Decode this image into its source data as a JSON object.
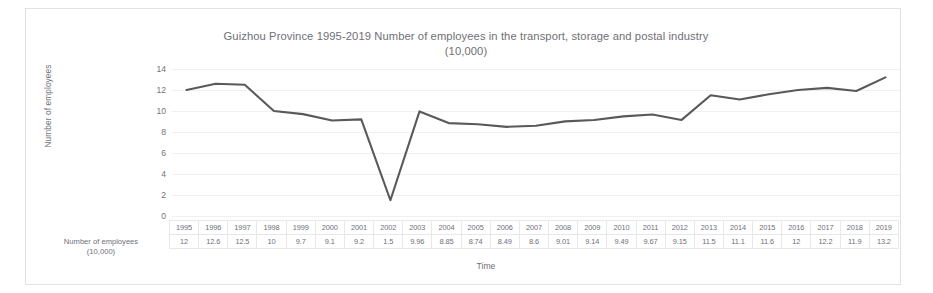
{
  "chart_data": {
    "type": "line",
    "title": "Guizhou Province 1995-2019 Number of employees in the transport, storage and postal industry (10,000)",
    "title_line1": "Guizhou Province 1995-2019 Number of employees in the transport, storage and postal industry",
    "title_line2": "(10,000)",
    "xlabel": "Time",
    "ylabel": "Number of employees",
    "ylim": [
      0,
      14
    ],
    "yticks": [
      0,
      2,
      4,
      6,
      8,
      10,
      12,
      14
    ],
    "grid": true,
    "legend": "none",
    "line_color": "#595959",
    "categories": [
      "1995",
      "1996",
      "1997",
      "1998",
      "1999",
      "2000",
      "2001",
      "2002",
      "2003",
      "2004",
      "2005",
      "2006",
      "2007",
      "2008",
      "2009",
      "2010",
      "2011",
      "2012",
      "2013",
      "2014",
      "2015",
      "2016",
      "2017",
      "2018",
      "2019"
    ],
    "values": [
      12,
      12.6,
      12.5,
      10,
      9.7,
      9.1,
      9.2,
      1.5,
      9.96,
      8.85,
      8.74,
      8.49,
      8.6,
      9.01,
      9.14,
      9.49,
      9.67,
      9.15,
      11.5,
      11.1,
      11.6,
      12,
      12.2,
      11.9,
      13.2
    ],
    "value_labels": [
      "12",
      "12.6",
      "12.5",
      "10",
      "9.7",
      "9.1",
      "9.2",
      "1.5",
      "9.96",
      "8.85",
      "8.74",
      "8.49",
      "8.6",
      "9.01",
      "9.14",
      "9.49",
      "9.67",
      "9.15",
      "11.5",
      "11.1",
      "11.6",
      "12",
      "12.2",
      "11.9",
      "13.2"
    ],
    "table_row_label": "Number of employees (10,000)",
    "table_row_label_line1": "Number of employees",
    "table_row_label_line2": "(10,000)"
  }
}
